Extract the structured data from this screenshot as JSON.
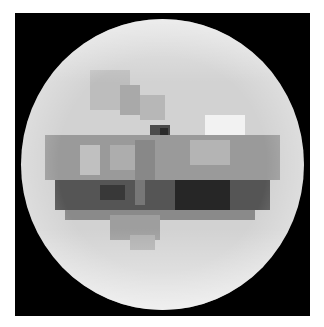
{
  "image": {
    "subject": "grayscale pixelated sphere on black square",
    "background_color": "#ffffff",
    "frame_color": "#000000",
    "sphere_base_color": "#d2d2d2"
  },
  "blocks": [
    {
      "x": 90,
      "y": 70,
      "w": 40,
      "h": 40,
      "c": "#bdbdbd"
    },
    {
      "x": 120,
      "y": 85,
      "w": 20,
      "h": 30,
      "c": "#a9a9a9"
    },
    {
      "x": 140,
      "y": 95,
      "w": 25,
      "h": 25,
      "c": "#b7b7b7"
    },
    {
      "x": 205,
      "y": 115,
      "w": 40,
      "h": 20,
      "c": "#f2f2f2"
    },
    {
      "x": 150,
      "y": 125,
      "w": 20,
      "h": 15,
      "c": "#4a4a4a"
    },
    {
      "x": 160,
      "y": 128,
      "w": 8,
      "h": 8,
      "c": "#2a2a2a"
    },
    {
      "x": 45,
      "y": 135,
      "w": 235,
      "h": 45,
      "c": "#9a9a9a"
    },
    {
      "x": 80,
      "y": 145,
      "w": 20,
      "h": 30,
      "c": "#c0c0c0"
    },
    {
      "x": 110,
      "y": 145,
      "w": 25,
      "h": 25,
      "c": "#adadad"
    },
    {
      "x": 190,
      "y": 140,
      "w": 40,
      "h": 25,
      "c": "#b4b4b4"
    },
    {
      "x": 135,
      "y": 140,
      "w": 20,
      "h": 40,
      "c": "#888888"
    },
    {
      "x": 55,
      "y": 180,
      "w": 215,
      "h": 30,
      "c": "#555555"
    },
    {
      "x": 100,
      "y": 185,
      "w": 25,
      "h": 15,
      "c": "#383838"
    },
    {
      "x": 175,
      "y": 180,
      "w": 55,
      "h": 30,
      "c": "#262626"
    },
    {
      "x": 135,
      "y": 180,
      "w": 10,
      "h": 25,
      "c": "#777777"
    },
    {
      "x": 65,
      "y": 210,
      "w": 190,
      "h": 10,
      "c": "#8a8a8a"
    },
    {
      "x": 110,
      "y": 215,
      "w": 50,
      "h": 25,
      "c": "#9e9e9e"
    },
    {
      "x": 130,
      "y": 235,
      "w": 25,
      "h": 15,
      "c": "#b0b0b0"
    }
  ]
}
